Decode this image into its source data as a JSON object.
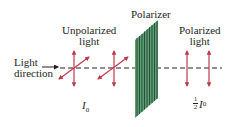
{
  "diagram": {
    "labels": {
      "unpolarized_line1": "Unpolarized",
      "unpolarized_line2": "light",
      "polarizer": "Polarizer",
      "polarized_line1": "Polarized",
      "polarized_line2": "light",
      "direction_line1": "Light",
      "direction_line2": "direction",
      "intensity_in_symbol": "I",
      "intensity_in_sub": "0",
      "intensity_out_num": "1",
      "intensity_out_den": "2",
      "intensity_out_symbol": "I",
      "intensity_out_sub": "0"
    },
    "colors": {
      "arrow": "#c0394b",
      "polarizer_fill": "#5a9e74",
      "polarizer_lines": "#1f3d2a",
      "text": "#231f20"
    }
  }
}
